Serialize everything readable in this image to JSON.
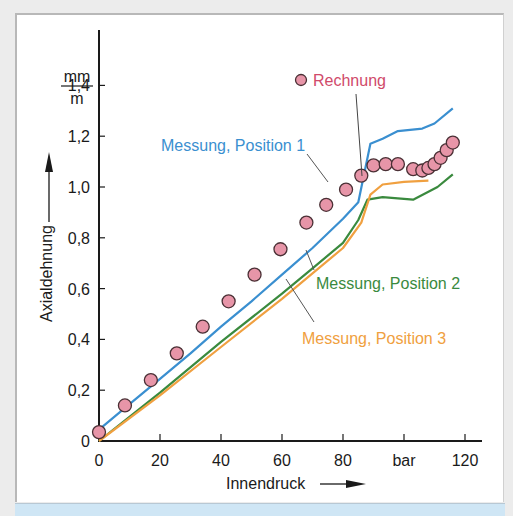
{
  "chart_data": {
    "type": "line",
    "title": "",
    "xlabel": "Innendruck",
    "xunit": "bar",
    "ylabel": "Axialdehnung",
    "yunit_num": "mm",
    "yunit_den": "m",
    "xlim": [
      0,
      120
    ],
    "ylim": [
      0,
      1.4
    ],
    "x_ticks": [
      0,
      20,
      40,
      60,
      80,
      100,
      120
    ],
    "x_tick_labels": [
      "0",
      "20",
      "40",
      "60",
      "80",
      "bar",
      "120"
    ],
    "y_ticks": [
      0,
      0.2,
      0.4,
      0.6,
      0.8,
      1.0,
      1.2,
      1.4
    ],
    "y_tick_labels": [
      "0",
      "0,2",
      "0,4",
      "0,6",
      "0,8",
      "1,0",
      "1,2",
      "1,4"
    ],
    "grid": false,
    "series": [
      {
        "name": "Messung, Position 1",
        "kind": "line",
        "color": "#3a8fd0",
        "x": [
          0,
          10,
          20,
          30,
          40,
          50,
          60,
          70,
          80,
          85,
          89,
          93,
          98,
          106,
          110,
          116
        ],
        "y": [
          0.045,
          0.145,
          0.245,
          0.345,
          0.45,
          0.55,
          0.655,
          0.76,
          0.875,
          0.94,
          1.17,
          1.19,
          1.22,
          1.23,
          1.25,
          1.31
        ]
      },
      {
        "name": "Messung, Position 2",
        "kind": "line",
        "color": "#3a8a3e",
        "x": [
          0,
          20,
          40,
          60,
          70,
          80,
          85,
          88,
          93,
          103,
          111,
          116
        ],
        "y": [
          0,
          0.19,
          0.39,
          0.58,
          0.68,
          0.78,
          0.87,
          0.95,
          0.96,
          0.95,
          1.0,
          1.05
        ]
      },
      {
        "name": "Messung, Position 3",
        "kind": "line",
        "color": "#f0a040",
        "x": [
          0,
          20,
          40,
          60,
          70,
          80,
          86,
          89,
          93,
          100,
          108
        ],
        "y": [
          0,
          0.18,
          0.37,
          0.56,
          0.66,
          0.76,
          0.86,
          0.97,
          1.01,
          1.02,
          1.025
        ]
      },
      {
        "name": "Rechnung",
        "kind": "scatter",
        "color": "#e795a8",
        "x": [
          0,
          8.5,
          17,
          25.5,
          34,
          42.5,
          51,
          59.5,
          68,
          74.5,
          81,
          86,
          90,
          94,
          98,
          103,
          106,
          108,
          110,
          112,
          114,
          116
        ],
        "y": [
          0.035,
          0.14,
          0.24,
          0.345,
          0.45,
          0.55,
          0.655,
          0.755,
          0.86,
          0.93,
          0.99,
          1.045,
          1.085,
          1.09,
          1.09,
          1.07,
          1.065,
          1.075,
          1.09,
          1.115,
          1.145,
          1.175
        ]
      }
    ],
    "annotations": [
      {
        "text": "Rechnung",
        "color": "#d04a6a",
        "legend_marker": true
      },
      {
        "text": "Messung, Position 1",
        "color": "#3a8fd0"
      },
      {
        "text": "Messung, Position 2",
        "color": "#3a8a3e"
      },
      {
        "text": "Messung, Position 3",
        "color": "#f0a040"
      }
    ]
  }
}
